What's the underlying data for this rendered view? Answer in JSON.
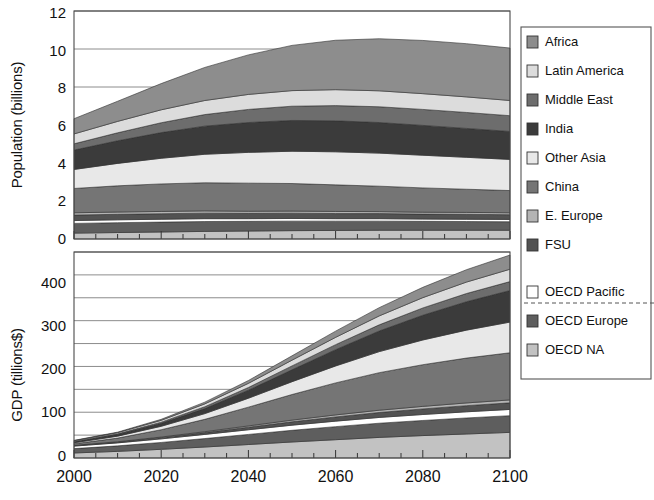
{
  "figure": {
    "title": "",
    "background": "#ffffff"
  },
  "legend": {
    "name": "chart-legend",
    "separator_after": "FSU",
    "entries": [
      {
        "label": "Africa",
        "color": "#8d8d8d"
      },
      {
        "label": "Latin America",
        "color": "#dcdcdc"
      },
      {
        "label": "Middle East",
        "color": "#6d6d6d"
      },
      {
        "label": "India",
        "color": "#3b3b3b"
      },
      {
        "label": "Other Asia",
        "color": "#e8e8e8"
      },
      {
        "label": "China",
        "color": "#757575"
      },
      {
        "label": "E. Europe",
        "color": "#b4b4b4"
      },
      {
        "label": "FSU",
        "color": "#525252"
      },
      {
        "label": "OECD Pacific",
        "color": "#ffffff"
      },
      {
        "label": "OECD Europe",
        "color": "#5e5e5e"
      },
      {
        "label": "OECD NA",
        "color": "#c2c2c2"
      }
    ]
  },
  "chart_data": [
    {
      "id": "population-chart",
      "type": "area",
      "stacked": true,
      "title": "",
      "xlabel": "",
      "ylabel": "Population (billions)",
      "x": [
        2000,
        2010,
        2020,
        2030,
        2040,
        2050,
        2060,
        2070,
        2080,
        2090,
        2100
      ],
      "xlim": [
        2000,
        2100
      ],
      "ylim": [
        0,
        12
      ],
      "xticks": [
        2000,
        2020,
        2040,
        2060,
        2080,
        2100
      ],
      "yticks": [
        0,
        2,
        4,
        6,
        8,
        10,
        12
      ],
      "ytick_labels": [
        "0",
        "2",
        "4",
        "6",
        "8",
        "10",
        "12"
      ],
      "grid": true,
      "grid_axis": "y",
      "stack_order_bottom_to_top": [
        "OECD NA",
        "OECD Europe",
        "OECD Pacific",
        "FSU",
        "E. Europe",
        "China",
        "Other Asia",
        "India",
        "Middle East",
        "Latin America",
        "Africa"
      ],
      "series": [
        {
          "name": "OECD NA",
          "color": "#c2c2c2",
          "values": [
            0.31,
            0.34,
            0.37,
            0.4,
            0.42,
            0.44,
            0.45,
            0.46,
            0.46,
            0.46,
            0.46
          ]
        },
        {
          "name": "OECD Europe",
          "color": "#5e5e5e",
          "values": [
            0.51,
            0.52,
            0.52,
            0.52,
            0.51,
            0.5,
            0.49,
            0.48,
            0.47,
            0.46,
            0.45
          ]
        },
        {
          "name": "OECD Pacific",
          "color": "#ffffff",
          "values": [
            0.15,
            0.15,
            0.15,
            0.15,
            0.14,
            0.14,
            0.13,
            0.13,
            0.12,
            0.12,
            0.12
          ]
        },
        {
          "name": "FSU",
          "color": "#525252",
          "values": [
            0.29,
            0.29,
            0.29,
            0.29,
            0.28,
            0.28,
            0.27,
            0.27,
            0.26,
            0.26,
            0.25
          ]
        },
        {
          "name": "E. Europe",
          "color": "#b4b4b4",
          "values": [
            0.12,
            0.12,
            0.12,
            0.12,
            0.11,
            0.11,
            0.11,
            0.1,
            0.1,
            0.1,
            0.1
          ]
        },
        {
          "name": "China",
          "color": "#757575",
          "values": [
            1.28,
            1.38,
            1.45,
            1.48,
            1.48,
            1.45,
            1.4,
            1.34,
            1.28,
            1.22,
            1.17
          ]
        },
        {
          "name": "Other Asia",
          "color": "#e8e8e8",
          "values": [
            1.0,
            1.18,
            1.35,
            1.5,
            1.62,
            1.7,
            1.74,
            1.74,
            1.72,
            1.68,
            1.64
          ]
        },
        {
          "name": "India",
          "color": "#3b3b3b",
          "values": [
            1.02,
            1.19,
            1.35,
            1.48,
            1.57,
            1.62,
            1.63,
            1.61,
            1.57,
            1.52,
            1.47
          ]
        },
        {
          "name": "Middle East",
          "color": "#6d6d6d",
          "values": [
            0.33,
            0.42,
            0.52,
            0.61,
            0.69,
            0.75,
            0.8,
            0.83,
            0.84,
            0.84,
            0.83
          ]
        },
        {
          "name": "Latin America",
          "color": "#dcdcdc",
          "values": [
            0.52,
            0.6,
            0.68,
            0.74,
            0.79,
            0.82,
            0.84,
            0.84,
            0.83,
            0.82,
            0.8
          ]
        },
        {
          "name": "Africa",
          "color": "#8d8d8d",
          "values": [
            0.8,
            1.06,
            1.38,
            1.74,
            2.08,
            2.38,
            2.6,
            2.74,
            2.8,
            2.8,
            2.76
          ]
        }
      ],
      "totals": [
        6.33,
        7.25,
        8.18,
        9.03,
        9.69,
        10.19,
        10.46,
        10.54,
        10.45,
        10.28,
        10.05
      ]
    },
    {
      "id": "gdp-chart",
      "type": "area",
      "stacked": true,
      "title": "",
      "xlabel": "",
      "ylabel": "GDP (tillions$)",
      "x": [
        2000,
        2010,
        2020,
        2030,
        2040,
        2050,
        2060,
        2070,
        2080,
        2090,
        2100
      ],
      "xlim": [
        2000,
        2100
      ],
      "ylim": [
        0,
        450
      ],
      "xticks": [
        2000,
        2020,
        2040,
        2060,
        2080,
        2100
      ],
      "yticks": [
        0,
        50,
        100,
        150,
        200,
        250,
        300,
        350,
        400,
        450
      ],
      "ytick_labels_major": [
        "0",
        "100",
        "200",
        "300",
        "400"
      ],
      "grid": true,
      "grid_axis": "y",
      "stack_order_bottom_to_top": [
        "OECD NA",
        "OECD Europe",
        "OECD Pacific",
        "FSU",
        "E. Europe",
        "China",
        "Other Asia",
        "India",
        "Middle East",
        "Latin America",
        "Africa"
      ],
      "series": [
        {
          "name": "OECD NA",
          "color": "#c2c2c2",
          "values": [
            11.0,
            14.5,
            19.0,
            24.0,
            29.5,
            35.0,
            40.0,
            45.0,
            49.0,
            52.5,
            56.0
          ]
        },
        {
          "name": "OECD Europe",
          "color": "#5e5e5e",
          "values": [
            9.5,
            12.0,
            15.0,
            18.5,
            22.0,
            25.5,
            28.5,
            31.0,
            33.0,
            35.0,
            36.5
          ]
        },
        {
          "name": "OECD Pacific",
          "color": "#ffffff",
          "values": [
            5.5,
            6.5,
            7.8,
            9.0,
            10.2,
            11.2,
            12.0,
            12.6,
            13.0,
            13.4,
            13.6
          ]
        },
        {
          "name": "FSU",
          "color": "#525252",
          "values": [
            1.0,
            1.6,
            2.6,
            4.0,
            5.6,
            7.4,
            9.2,
            10.8,
            12.2,
            13.4,
            14.4
          ]
        },
        {
          "name": "E. Europe",
          "color": "#b4b4b4",
          "values": [
            0.6,
            0.9,
            1.4,
            2.0,
            2.8,
            3.6,
            4.4,
            5.0,
            5.6,
            6.0,
            6.4
          ]
        },
        {
          "name": "China",
          "color": "#757575",
          "values": [
            3.5,
            8.0,
            16.0,
            27.0,
            41.0,
            56.0,
            70.0,
            82.0,
            91.0,
            98.0,
            103.0
          ]
        },
        {
          "name": "Other Asia",
          "color": "#e8e8e8",
          "values": [
            2.2,
            4.2,
            7.5,
            12.5,
            19.5,
            28.0,
            37.0,
            46.0,
            54.0,
            61.0,
            67.0
          ]
        },
        {
          "name": "India",
          "color": "#3b3b3b",
          "values": [
            2.0,
            3.6,
            6.5,
            11.0,
            17.5,
            26.0,
            35.5,
            45.0,
            54.0,
            62.0,
            69.0
          ]
        },
        {
          "name": "Middle East",
          "color": "#6d6d6d",
          "values": [
            0.9,
            1.5,
            2.5,
            4.0,
            6.0,
            8.5,
            11.0,
            13.5,
            16.0,
            18.0,
            19.5
          ]
        },
        {
          "name": "Latin America",
          "color": "#dcdcdc",
          "values": [
            1.6,
            2.5,
            4.0,
            6.2,
            9.0,
            12.5,
            16.0,
            19.5,
            22.5,
            25.0,
            27.0
          ]
        },
        {
          "name": "Africa",
          "color": "#8d8d8d",
          "values": [
            0.7,
            1.2,
            2.2,
            3.8,
            6.2,
            9.5,
            13.5,
            18.0,
            22.5,
            27.0,
            31.0
          ]
        }
      ],
      "totals": [
        38.5,
        56.5,
        84.5,
        122.0,
        169.3,
        223.2,
        277.1,
        328.4,
        372.8,
        411.3,
        443.4
      ]
    }
  ]
}
